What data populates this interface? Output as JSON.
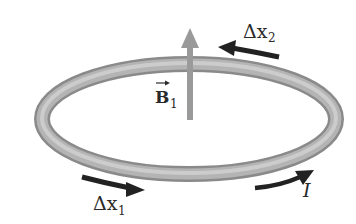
{
  "diagram": {
    "labels": {
      "b_field": "B",
      "b_field_subscript": "1",
      "dx1": "Δx",
      "dx1_subscript": "1",
      "dx2": "Δx",
      "dx2_subscript": "2",
      "current": "I"
    },
    "colors": {
      "ring": "#a8a8a8",
      "ring_highlight": "#d6d6d6",
      "ring_shadow": "#7a7a7a",
      "b_arrow": "#9a9a9a",
      "arrows": "#222222",
      "text": "#2a2a2a"
    }
  }
}
